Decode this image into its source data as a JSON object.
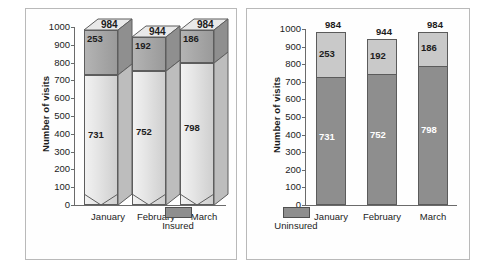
{
  "chart_data": [
    {
      "type": "bar",
      "id": "left-3d-stacked",
      "title": "",
      "style": "3d-stacked-column",
      "xlabel": "",
      "ylabel": "Number of visits",
      "categories": [
        "January",
        "February",
        "March"
      ],
      "ylim": [
        0,
        1000
      ],
      "yticks": [
        0,
        100,
        200,
        300,
        400,
        500,
        600,
        700,
        800,
        900,
        1000
      ],
      "grid": false,
      "legend_position": "bottom-right",
      "series": [
        {
          "name": "Insured",
          "values": [
            731,
            752,
            798
          ],
          "color": "#e4e4e4"
        },
        {
          "name": "Uninsured",
          "values": [
            253,
            192,
            186
          ],
          "color": "#a8a8a8"
        }
      ],
      "totals": [
        984,
        944,
        984
      ],
      "legend": [
        "Insured"
      ]
    },
    {
      "type": "bar",
      "id": "right-2d-stacked",
      "title": "",
      "style": "stacked-column",
      "xlabel": "",
      "ylabel": "Number of visits",
      "categories": [
        "January",
        "February",
        "March"
      ],
      "ylim": [
        0,
        1000
      ],
      "yticks": [
        0,
        100,
        200,
        300,
        400,
        500,
        600,
        700,
        800,
        900,
        1000
      ],
      "grid": false,
      "legend_position": "bottom-left",
      "series": [
        {
          "name": "Insured",
          "values": [
            731,
            752,
            798
          ],
          "color": "#8e8e8e"
        },
        {
          "name": "Uninsured",
          "values": [
            253,
            192,
            186
          ],
          "color": "#c9c9c9"
        }
      ],
      "totals": [
        984,
        944,
        984
      ],
      "legend": [
        "Uninsured"
      ]
    }
  ],
  "left_chart": {
    "y_axis_title": "Number of visits",
    "y_ticks": [
      "1000",
      "900",
      "800",
      "700",
      "600",
      "500",
      "400",
      "300",
      "200",
      "100",
      "0"
    ],
    "bars": [
      {
        "category": "January",
        "lower_value": "731",
        "upper_value": "253",
        "total": "984"
      },
      {
        "category": "February",
        "lower_value": "752",
        "upper_value": "192",
        "total": "944"
      },
      {
        "category": "March",
        "lower_value": "798",
        "upper_value": "186",
        "total": "984"
      }
    ],
    "legend": {
      "label": "Insured",
      "color": "#8e8e8e"
    }
  },
  "right_chart": {
    "y_axis_title": "Number of visits",
    "y_ticks": [
      "1000",
      "900",
      "800",
      "700",
      "600",
      "500",
      "400",
      "300",
      "200",
      "100",
      "0"
    ],
    "bars": [
      {
        "category": "January",
        "lower_value": "731",
        "upper_value": "253",
        "total": "984"
      },
      {
        "category": "February",
        "lower_value": "752",
        "upper_value": "192",
        "total": "944"
      },
      {
        "category": "March",
        "lower_value": "798",
        "upper_value": "186",
        "total": "984"
      }
    ],
    "legend": {
      "label": "Uninsured",
      "color": "#8e8e8e"
    }
  }
}
